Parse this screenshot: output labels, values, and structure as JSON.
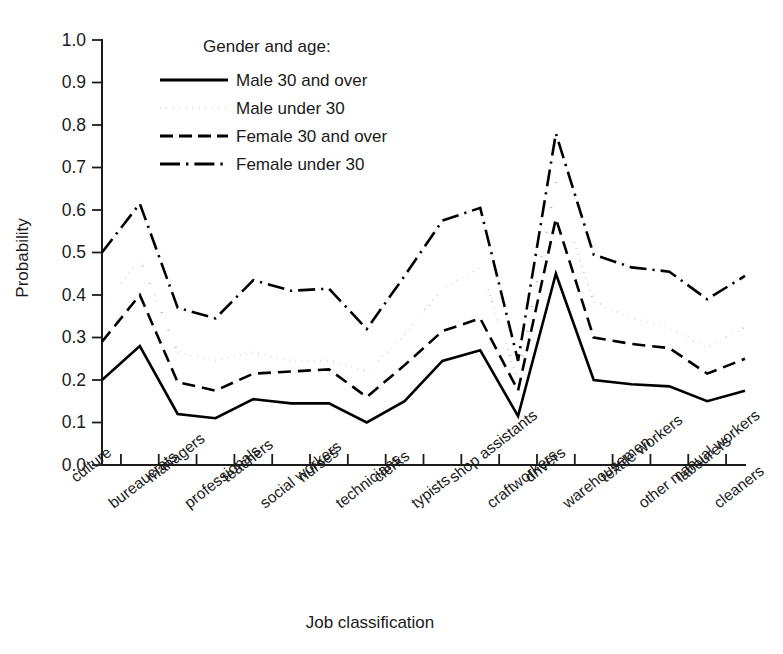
{
  "chart_data": {
    "type": "line",
    "title": "",
    "xlabel": "Job classification",
    "ylabel": "Probability",
    "ylim": [
      0.0,
      1.0
    ],
    "grid": false,
    "legend_position": "top-left-inside",
    "legend_title": "Gender and age:",
    "y_ticks": [
      "0.0",
      "0.1",
      "0.2",
      "0.3",
      "0.4",
      "0.5",
      "0.6",
      "0.7",
      "0.8",
      "0.9",
      "1.0"
    ],
    "y_tick_values": [
      0.0,
      0.1,
      0.2,
      0.3,
      0.4,
      0.5,
      0.6,
      0.7,
      0.8,
      0.9,
      1.0
    ],
    "categories": [
      "culture",
      "bureaucrats",
      "managers",
      "professionals",
      "teachers",
      "social workers",
      "nurses",
      "technicians",
      "clerks",
      "typists",
      "shop assistants",
      "craftworkers",
      "drivers",
      "warehousemen",
      "textile workers",
      "other manual workers",
      "labourers",
      "cleaners"
    ],
    "series": [
      {
        "name": "Male 30 and over",
        "style": "solid",
        "values": [
          0.2,
          0.28,
          0.12,
          0.11,
          0.155,
          0.145,
          0.145,
          0.1,
          0.15,
          0.245,
          0.27,
          0.115,
          0.45,
          0.2,
          0.19,
          0.185,
          0.15,
          0.175
        ]
      },
      {
        "name": "Male under 30",
        "style": "dotted",
        "values": [
          0.37,
          0.485,
          0.265,
          0.245,
          0.265,
          0.245,
          0.245,
          0.22,
          0.305,
          0.415,
          0.465,
          0.2,
          0.665,
          0.385,
          0.345,
          0.325,
          0.275,
          0.325
        ]
      },
      {
        "name": "Female 30 and over",
        "style": "dashed",
        "values": [
          0.29,
          0.4,
          0.195,
          0.175,
          0.215,
          0.22,
          0.225,
          0.16,
          0.235,
          0.315,
          0.345,
          0.175,
          0.58,
          0.3,
          0.285,
          0.275,
          0.215,
          0.25
        ]
      },
      {
        "name": "Female under 30",
        "style": "dashdot",
        "values": [
          0.5,
          0.615,
          0.37,
          0.345,
          0.435,
          0.41,
          0.415,
          0.32,
          0.445,
          0.575,
          0.605,
          0.245,
          0.78,
          0.495,
          0.465,
          0.455,
          0.39,
          0.445
        ]
      }
    ],
    "legend_entries": [
      {
        "label": "Male 30 and over",
        "style": "solid"
      },
      {
        "label": "Male under 30",
        "style": "dotted"
      },
      {
        "label": "Female 30 and over",
        "style": "dashed"
      },
      {
        "label": "Female under 30",
        "style": "dashdot"
      }
    ],
    "colors": {
      "line": "#000000",
      "axis": "#1c1c1c",
      "text": "#1a1a1a",
      "background": "#ffffff"
    }
  }
}
